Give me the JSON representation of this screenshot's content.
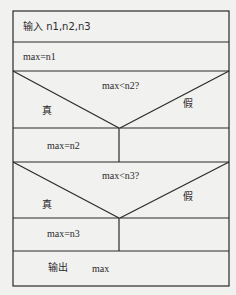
{
  "diagram": {
    "type": "NS-flowchart (Nassi–Shneiderman)",
    "rows": [
      {
        "kind": "process",
        "label": "输入 n1,n2,n3"
      },
      {
        "kind": "process",
        "label": "max=n1"
      },
      {
        "kind": "decision",
        "condition": "max<n2?",
        "true_label": "真",
        "false_label": "假",
        "true_branch": "max=n2",
        "false_branch": ""
      },
      {
        "kind": "decision",
        "condition": "max<n3?",
        "true_label": "真",
        "false_label": "假",
        "true_branch": "max=n3",
        "false_branch": ""
      },
      {
        "kind": "output",
        "keyword": "输出",
        "value": "max"
      }
    ],
    "colors": {
      "background": "#f1f1ef",
      "line": "#2a2a2a",
      "text": "#2b2b2b"
    }
  }
}
